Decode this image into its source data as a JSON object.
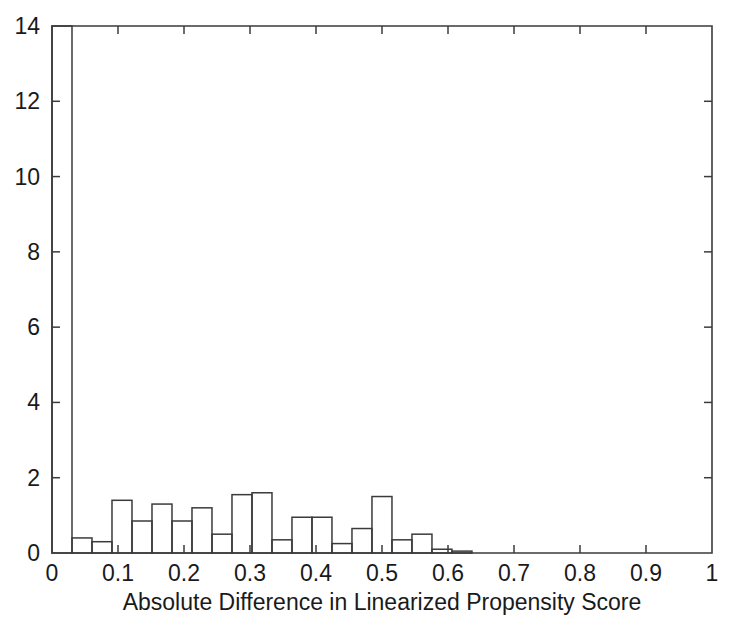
{
  "chart_data": {
    "type": "bar",
    "title": "",
    "subtitle": "",
    "xlabel": "Absolute Difference in Linearized Propensity Score",
    "ylabel": "",
    "xlim": [
      0,
      1
    ],
    "ylim": [
      0,
      14
    ],
    "grid": false,
    "legend": null,
    "xticks": [
      0,
      0.1,
      0.2,
      0.3,
      0.4,
      0.5,
      0.6,
      0.7,
      0.8,
      0.9,
      1
    ],
    "xtick_labels": [
      "0",
      "0.1",
      "0.2",
      "0.3",
      "0.4",
      "0.5",
      "0.6",
      "0.7",
      "0.8",
      "0.9",
      "1"
    ],
    "yticks": [
      0,
      2,
      4,
      6,
      8,
      10,
      12,
      14
    ],
    "ytick_labels": [
      "0",
      "2",
      "4",
      "6",
      "8",
      "10",
      "12",
      "14"
    ],
    "bin_width": 0.0303,
    "bin_edges": [
      0.0,
      0.0303,
      0.0606,
      0.0909,
      0.1212,
      0.1515,
      0.1818,
      0.2121,
      0.2424,
      0.2727,
      0.303,
      0.3333,
      0.3636,
      0.3939,
      0.4242,
      0.4545,
      0.4848,
      0.5152,
      0.5455,
      0.5758,
      0.6061,
      0.6364,
      0.6667,
      0.697
    ],
    "bin_centers": [
      0.015,
      0.045,
      0.076,
      0.106,
      0.136,
      0.167,
      0.197,
      0.227,
      0.258,
      0.288,
      0.318,
      0.348,
      0.379,
      0.409,
      0.439,
      0.47,
      0.5,
      0.53,
      0.561,
      0.591,
      0.621,
      0.652,
      0.682
    ],
    "values": [
      14.0,
      0.4,
      0.3,
      1.4,
      0.85,
      1.3,
      0.85,
      1.2,
      0.5,
      1.55,
      1.6,
      0.35,
      0.95,
      0.95,
      0.25,
      0.65,
      1.5,
      0.35,
      0.5,
      0.1,
      0.05
    ],
    "series": [
      {
        "name": "Absolute Difference in Linearized Propensity Score",
        "values": [
          14.0,
          0.4,
          0.3,
          1.4,
          0.85,
          1.3,
          0.85,
          1.2,
          0.5,
          1.55,
          1.6,
          0.35,
          0.95,
          0.95,
          0.25,
          0.65,
          1.5,
          0.35,
          0.5,
          0.1,
          0.05
        ]
      }
    ],
    "annotations": []
  },
  "style": {
    "line_color": "#3b3b3b",
    "bar_fill": "none",
    "text_color": "#1a1a1a",
    "background": "#ffffff"
  }
}
